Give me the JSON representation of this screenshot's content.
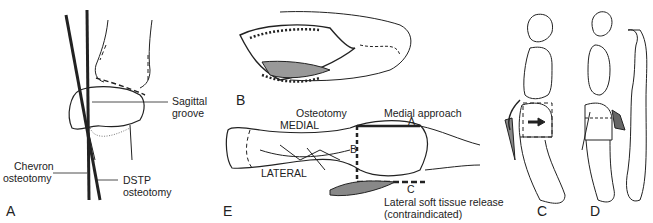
{
  "figure": {
    "panels": [
      {
        "id": "A",
        "label": "A"
      },
      {
        "id": "B",
        "label": "B"
      },
      {
        "id": "C",
        "label": "C"
      },
      {
        "id": "D",
        "label": "D"
      },
      {
        "id": "E",
        "label": "E"
      }
    ]
  },
  "panel_a": {
    "sagittal_groove_1": "Sagittal",
    "sagittal_groove_2": "groove",
    "chevron_1": "Chevron",
    "chevron_2": "osteotomy",
    "dstp_1": "DSTP",
    "dstp_2": "osteotomy"
  },
  "panel_e": {
    "osteotomy": "Osteotomy",
    "medial_approach": "Medial approach",
    "medial": "MEDIAL",
    "lateral": "LATERAL",
    "marker_a": "A",
    "marker_b": "B",
    "marker_c": "C",
    "lateral_release_1": "Lateral soft tissue release",
    "lateral_release_2": "(contraindicated)"
  },
  "colors": {
    "line": "#222222",
    "shade": "#999999",
    "background": "#ffffff"
  }
}
